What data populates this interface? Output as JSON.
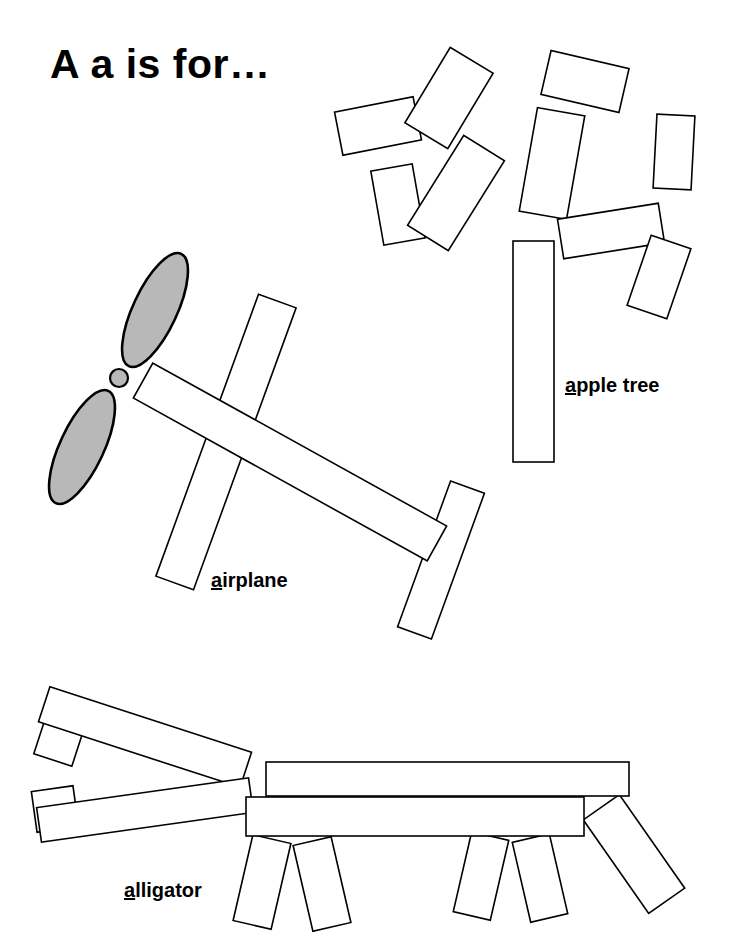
{
  "page": {
    "title": "A a is for…",
    "background_color": "#ffffff",
    "ink_color": "#000000",
    "shape_fill": "#ffffff",
    "propeller_fill": "#b8b8b8",
    "stroke_width": 1.6,
    "width": 734,
    "height": 952
  },
  "captions": {
    "apple_tree": {
      "initial": "a",
      "rest": "pple tree"
    },
    "airplane": {
      "initial": "a",
      "rest": "irplane"
    },
    "alligator": {
      "initial": "a",
      "rest": "lligator"
    }
  },
  "figures": {
    "apple_tree": {
      "name": "apple-tree",
      "trunk": {
        "x": 513,
        "y": 241,
        "w": 41,
        "h": 221,
        "rot": 0
      },
      "leaves": [
        {
          "x": 338,
          "y": 104,
          "w": 80,
          "h": 44,
          "rot": -11
        },
        {
          "x": 424,
          "y": 54,
          "w": 50,
          "h": 88,
          "rot": 31
        },
        {
          "x": 377,
          "y": 167,
          "w": 42,
          "h": 75,
          "rot": -10
        },
        {
          "x": 432,
          "y": 140,
          "w": 48,
          "h": 106,
          "rot": 32
        },
        {
          "x": 545,
          "y": 59,
          "w": 80,
          "h": 45,
          "rot": 13
        },
        {
          "x": 528,
          "y": 111,
          "w": 48,
          "h": 105,
          "rot": 10
        },
        {
          "x": 655,
          "y": 115,
          "w": 38,
          "h": 74,
          "rot": 3
        },
        {
          "x": 560,
          "y": 211,
          "w": 102,
          "h": 40,
          "rot": -9
        },
        {
          "x": 638,
          "y": 240,
          "w": 42,
          "h": 74,
          "rot": 19
        }
      ]
    },
    "airplane": {
      "name": "airplane",
      "fuselage": {
        "cx": 290,
        "cy": 462,
        "w": 336,
        "h": 40,
        "rot": 29
      },
      "wing": {
        "cx": 226,
        "cy": 442,
        "w": 40,
        "h": 300,
        "rot": 20
      },
      "tail": {
        "cx": 441,
        "cy": 560,
        "w": 36,
        "h": 155,
        "rot": 20
      },
      "propeller": {
        "hub": {
          "cx": 119,
          "cy": 378,
          "r": 9
        },
        "blades": [
          {
            "cx": 155,
            "cy": 310,
            "rx": 22,
            "ry": 62,
            "rot": 25
          },
          {
            "cx": 82,
            "cy": 447,
            "rx": 22,
            "ry": 62,
            "rot": 25
          }
        ]
      }
    },
    "alligator": {
      "name": "alligator",
      "upper_jaw": {
        "cx": 145,
        "cy": 737,
        "w": 212,
        "h": 37,
        "rot": 18
      },
      "lower_jaw": {
        "cx": 145,
        "cy": 810,
        "w": 214,
        "h": 35,
        "rot": -8
      },
      "nostril_up": {
        "cx": 59,
        "cy": 741,
        "w": 40,
        "h": 40,
        "rot": 18
      },
      "nostril_lo": {
        "cx": 55,
        "cy": 809,
        "w": 42,
        "h": 41,
        "rot": -8
      },
      "body_top": {
        "x": 266,
        "y": 762,
        "w": 363,
        "h": 34,
        "rot": 0
      },
      "body_low": {
        "x": 246,
        "y": 797,
        "w": 338,
        "h": 39,
        "rot": 0
      },
      "tail": {
        "cx": 634,
        "cy": 854,
        "w": 44,
        "h": 114,
        "rot": -35
      },
      "legs": [
        {
          "cx": 262,
          "cy": 882,
          "w": 39,
          "h": 88,
          "rot": 13
        },
        {
          "cx": 322,
          "cy": 884,
          "w": 39,
          "h": 88,
          "rot": -13
        },
        {
          "cx": 481,
          "cy": 876,
          "w": 38,
          "h": 82,
          "rot": 13
        },
        {
          "cx": 540,
          "cy": 878,
          "w": 38,
          "h": 82,
          "rot": -13
        }
      ]
    }
  }
}
